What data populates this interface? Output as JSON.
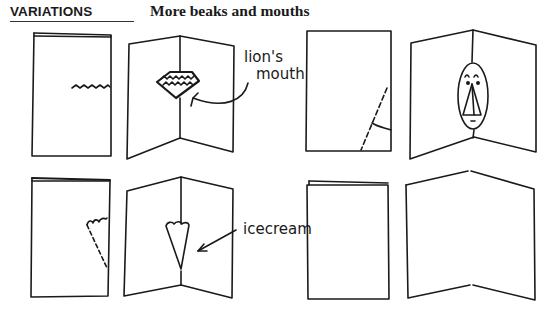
{
  "header": {
    "section_label": "VARIATIONS",
    "title": "More beaks and mouths"
  },
  "figures": [
    {
      "id": "fig-1",
      "description": "folded card with zigzag cut"
    },
    {
      "id": "fig-2",
      "description": "opened card showing lion's mouth pop-up",
      "annotation": "lion's mouth"
    },
    {
      "id": "fig-3",
      "description": "folded card with dashed fold line and cut"
    },
    {
      "id": "fig-4",
      "description": "opened card showing face with beak pop-up"
    },
    {
      "id": "fig-5",
      "description": "folded card with scalloped cut and dashed fold"
    },
    {
      "id": "fig-6",
      "description": "opened card showing icecream pop-up",
      "annotation": "icecream"
    },
    {
      "id": "fig-7",
      "description": "blank folded card"
    },
    {
      "id": "fig-8",
      "description": "blank opened card"
    }
  ],
  "annotations": {
    "lions_line1": "lion's",
    "lions_line2": "mouth",
    "icecream": "icecream"
  },
  "colors": {
    "ink": "#1a1a1a",
    "paper": "#ffffff"
  }
}
